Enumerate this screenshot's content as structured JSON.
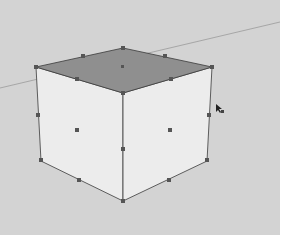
{
  "viewport": {
    "background": "#d3d3d3",
    "tool": "scale"
  },
  "scene": {
    "object": "cube",
    "selected": true,
    "colors": {
      "top_face": "#8f8f8f",
      "side_faces": "#ececec",
      "edges": "#3a3a3a",
      "axis_line": "#9a9a9a",
      "grip": "#555555"
    }
  },
  "cursor": {
    "icon": "scale-cursor-icon"
  }
}
